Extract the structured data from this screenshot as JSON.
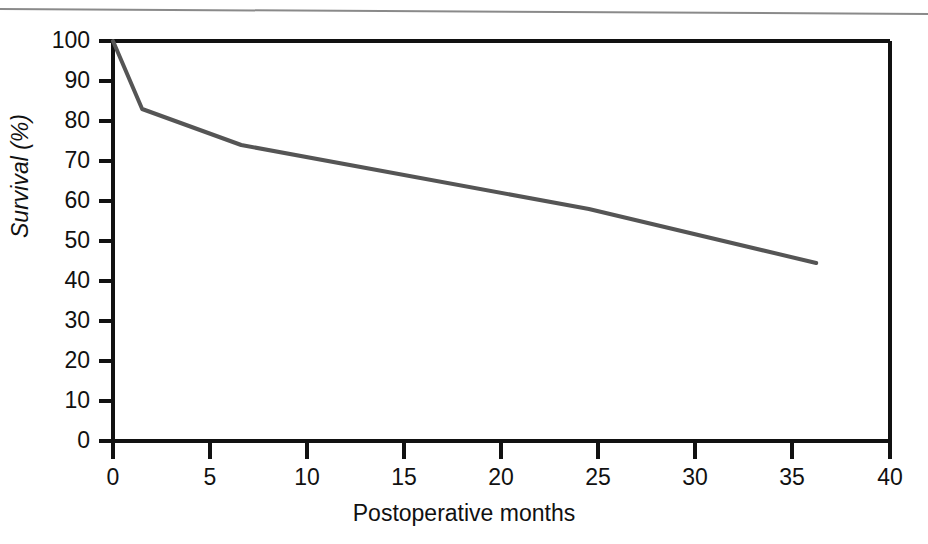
{
  "figure": {
    "background_color": "#ffffff",
    "axis_color": "#111111",
    "line_color": "#555555",
    "top_rule_color": "#8a8a8a"
  },
  "labels": {
    "xlabel": "Postoperative months",
    "ylabel": "Survival (%)"
  },
  "axes": {
    "x_ticks": [
      "0",
      "5",
      "10",
      "15",
      "20",
      "25",
      "30",
      "35",
      "40"
    ],
    "y_ticks": [
      "100",
      "90",
      "80",
      "70",
      "60",
      "50",
      "40",
      "30",
      "20",
      "10",
      "0"
    ]
  },
  "chart_data": {
    "type": "line",
    "title": "",
    "xlabel": "Postoperative months",
    "ylabel": "Survival (%)",
    "xlim": [
      0,
      40
    ],
    "ylim": [
      0,
      100
    ],
    "xticks": [
      0,
      5,
      10,
      15,
      20,
      25,
      30,
      35,
      40
    ],
    "yticks": [
      0,
      10,
      20,
      30,
      40,
      50,
      60,
      70,
      80,
      90,
      100
    ],
    "grid": false,
    "legend": false,
    "series": [
      {
        "name": "Survival",
        "color": "#555555",
        "x": [
          0,
          1.5,
          6.6,
          24.5,
          36.2
        ],
        "values": [
          100,
          83,
          74,
          58,
          44.5
        ]
      }
    ]
  }
}
